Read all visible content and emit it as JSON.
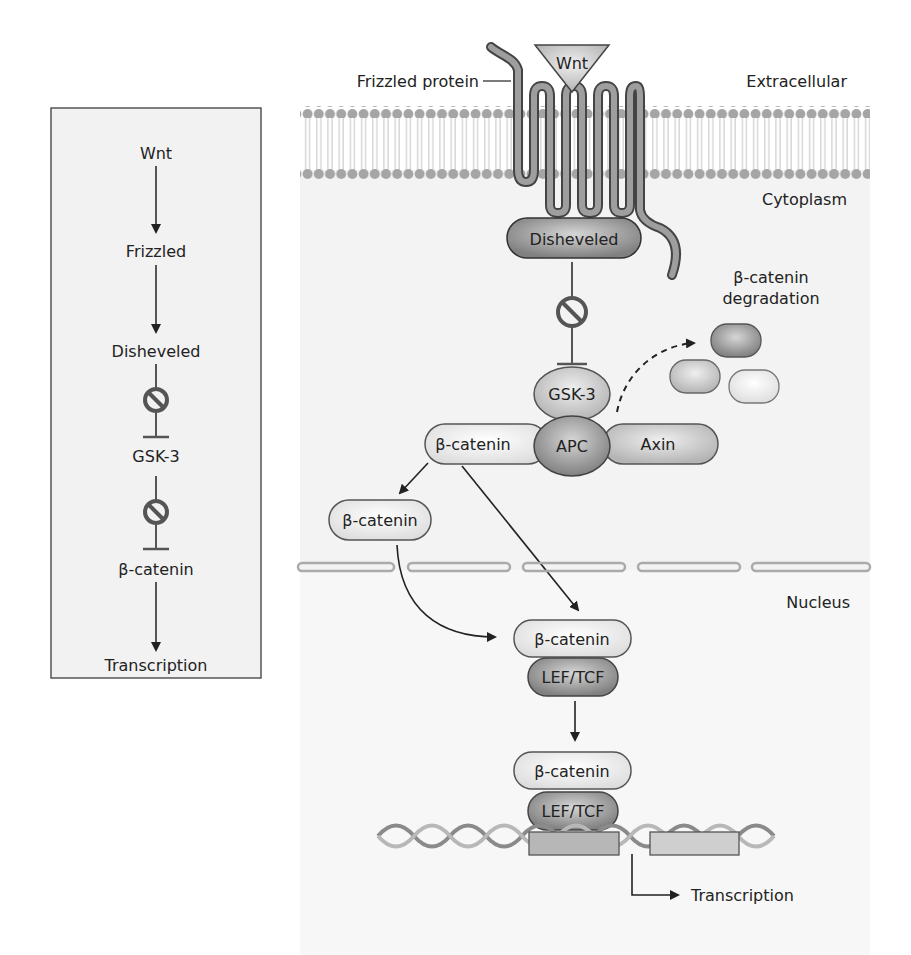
{
  "summary_box": {
    "steps": [
      "Wnt",
      "Frizzled",
      "Disheveled",
      "GSK-3",
      "β-catenin",
      "Transcription"
    ]
  },
  "regions": {
    "extracellular": "Extracellular",
    "cytoplasm": "Cytoplasm",
    "nucleus": "Nucleus"
  },
  "receptor": {
    "ligand": "Wnt",
    "frizzled_label": "Frizzled protein",
    "disheveled": "Disheveled"
  },
  "complex": {
    "gsk3": "GSK-3",
    "apc": "APC",
    "axin": "Axin",
    "beta_catenin": "β-catenin"
  },
  "degradation": {
    "line1": "β-catenin",
    "line2": "degradation"
  },
  "free_beta_catenin": "β-catenin",
  "nuclear": {
    "beta_catenin_1": "β-catenin",
    "lef_tcf_1": "LEF/TCF",
    "beta_catenin_2": "β-catenin",
    "lef_tcf_2": "LEF/TCF",
    "transcription": "Transcription"
  },
  "colors": {
    "membrane": "#a9a9a9",
    "cytoplasm_bg": "#f4f4f4",
    "dark_protein": "#8e8e8e",
    "light_protein": "#e6e6e6",
    "stroke": "#333333"
  }
}
